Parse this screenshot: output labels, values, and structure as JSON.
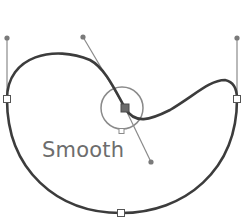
{
  "diagram": {
    "label": "Smooth",
    "colors": {
      "path": "#3c3c3c",
      "handle": "#8a8a8a",
      "circle": "#8a8a8a",
      "anchor_fill": "#ffffff",
      "anchor_stroke": "#555555",
      "selected_anchor": "#6a6a6a",
      "label": "#6d6d6d"
    },
    "anchors": [
      {
        "name": "left",
        "x": 7,
        "y": 99
      },
      {
        "name": "smooth",
        "x": 125,
        "y": 108
      },
      {
        "name": "right",
        "x": 237,
        "y": 99
      },
      {
        "name": "bottom",
        "x": 121,
        "y": 213
      }
    ],
    "handles": [
      {
        "name": "left-handle",
        "from": [
          7,
          99
        ],
        "to": [
          7,
          38
        ]
      },
      {
        "name": "smooth-handle-in",
        "from": [
          125,
          108
        ],
        "to": [
          83,
          37
        ]
      },
      {
        "name": "smooth-handle-out",
        "from": [
          125,
          108
        ],
        "to": [
          151,
          162
        ]
      },
      {
        "name": "right-handle",
        "from": [
          237,
          99
        ],
        "to": [
          237,
          38
        ]
      }
    ],
    "highlight_circle": {
      "cx": 122,
      "cy": 108,
      "r": 21
    }
  }
}
